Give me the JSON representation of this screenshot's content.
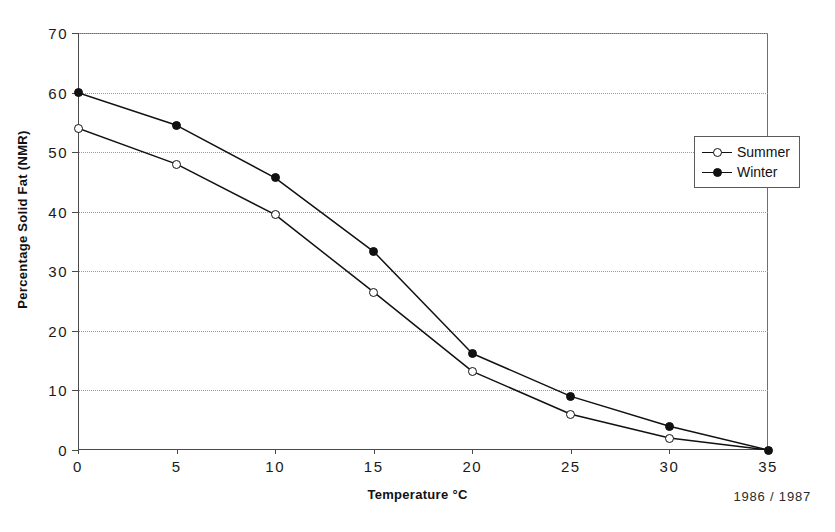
{
  "chart_data": {
    "type": "line",
    "title": "",
    "xlabel": "Temperature °C",
    "ylabel": "Percentage Solid Fat (NMR)",
    "xlim": [
      0,
      35
    ],
    "ylim": [
      0,
      70
    ],
    "x": [
      0,
      5,
      10,
      15,
      20,
      25,
      30,
      35
    ],
    "xticks": [
      "0",
      "5",
      "10",
      "15",
      "20",
      "25",
      "30",
      "35"
    ],
    "yticks": [
      "0",
      "10",
      "20",
      "30",
      "40",
      "50",
      "60",
      "70"
    ],
    "grid": "horizontal-dotted",
    "legend_position": "top-right-inside",
    "series": [
      {
        "name": "Summer",
        "marker": "open-circle",
        "values": [
          54,
          48,
          39.5,
          26.5,
          13.2,
          6,
          2,
          0
        ]
      },
      {
        "name": "Winter",
        "marker": "filled-circle",
        "values": [
          60,
          54.5,
          45.7,
          33.3,
          16.2,
          9,
          4,
          0
        ]
      }
    ],
    "annotations": [
      "1986 / 1987"
    ]
  },
  "axes": {
    "y_title": "Percentage Solid Fat (NMR)",
    "x_title": "Temperature °C"
  },
  "legend": {
    "entries": [
      {
        "label": "Summer"
      },
      {
        "label": "Winter"
      }
    ]
  },
  "footer": {
    "note": "1986 / 1987"
  },
  "colors": {
    "line": "#111111",
    "grid": "#9a9a9a",
    "axis": "#4a4a4a",
    "background": "#ffffff"
  }
}
